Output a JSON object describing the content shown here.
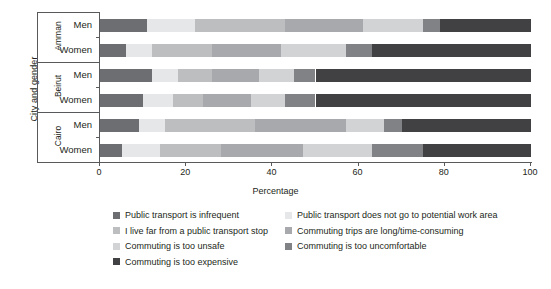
{
  "chart_data": {
    "type": "bar",
    "subtype": "horizontal-stacked-100",
    "title": "",
    "xlabel": "Percentage",
    "ylabel": "City and gender",
    "xlim": [
      0,
      100
    ],
    "xticks": [
      0,
      20,
      40,
      60,
      80,
      100
    ],
    "grid": false,
    "legend_position": "bottom",
    "groups": [
      {
        "city": "Amman",
        "rows": [
          "Men",
          "Women"
        ]
      },
      {
        "city": "Beirut",
        "rows": [
          "Men",
          "Women"
        ]
      },
      {
        "city": "Cairo",
        "rows": [
          "Men",
          "Women"
        ]
      }
    ],
    "categories": [
      "Amman Men",
      "Amman Women",
      "Beirut Men",
      "Beirut Women",
      "Cairo Men",
      "Cairo Women"
    ],
    "series": [
      {
        "name": "Public transport is infrequent",
        "color": "#6d6e71",
        "values": [
          11,
          6,
          12,
          10,
          9,
          5
        ]
      },
      {
        "name": "Public transport does not go to potential work area",
        "color": "#e6e7e8",
        "values": [
          11,
          6,
          6,
          7,
          6,
          9
        ]
      },
      {
        "name": "I live far from a public transport stop",
        "color": "#bcbec0",
        "values": [
          21,
          14,
          8,
          7,
          21,
          14
        ]
      },
      {
        "name": "Commuting trips are long/time-consuming",
        "color": "#a7a9ac",
        "values": [
          18,
          16,
          11,
          11,
          21,
          19
        ]
      },
      {
        "name": "Commuting is too unsafe",
        "color": "#d1d3d4",
        "values": [
          14,
          15,
          8,
          8,
          9,
          16
        ]
      },
      {
        "name": "Commuting is too uncomfortable",
        "color": "#808285",
        "values": [
          4,
          6,
          5,
          7,
          4,
          12
        ]
      },
      {
        "name": "Commuting is too expensive",
        "color": "#414042",
        "values": [
          21,
          37,
          50,
          50,
          30,
          25
        ]
      }
    ]
  },
  "axis": {
    "y_title": "City and gender",
    "x_title": "Percentage"
  },
  "legend": {
    "column1": [
      {
        "label": "Public transport is infrequent",
        "color": "#6d6e71"
      },
      {
        "label": "I live far from a public transport stop",
        "color": "#bcbec0"
      },
      {
        "label": "Commuting is too unsafe",
        "color": "#d1d3d4"
      },
      {
        "label": "Commuting is too expensive",
        "color": "#414042"
      }
    ],
    "column2": [
      {
        "label": "Public transport does not go to potential work area",
        "color": "#e6e7e8"
      },
      {
        "label": "Commuting trips are long/time-consuming",
        "color": "#a7a9ac"
      },
      {
        "label": "Commuting is too uncomfortable",
        "color": "#808285"
      }
    ]
  }
}
